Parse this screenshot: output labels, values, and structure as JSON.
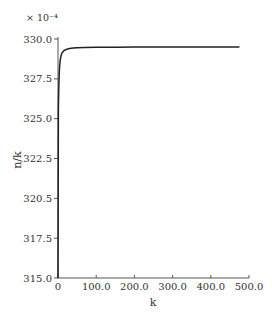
{
  "chart_data": {
    "type": "line",
    "title": "",
    "xlabel": "k",
    "ylabel": "n/k",
    "y_scale_note": "× 10⁻⁴",
    "xlim": [
      0,
      500
    ],
    "ylim": [
      315.0,
      330.0
    ],
    "grid": false,
    "legend": null,
    "x_ticks": [
      0,
      100,
      200,
      300,
      400,
      500
    ],
    "x_tick_labels": [
      "0",
      "100.0",
      "200.0",
      "300.0",
      "400.0",
      "500.0"
    ],
    "y_ticks": [
      315.0,
      317.5,
      320.0,
      322.5,
      325.0,
      327.5,
      330.0
    ],
    "y_tick_labels": [
      "315.0",
      "317.5",
      "320.5",
      "322.5",
      "325.0",
      "327.5",
      "330.0"
    ],
    "series": [
      {
        "name": "n/k",
        "color": "#222222",
        "x": [
          1,
          2,
          3,
          4,
          6,
          8,
          10,
          13,
          16,
          20,
          25,
          30,
          40,
          50,
          70,
          100,
          150,
          200,
          250,
          300,
          350,
          400,
          450,
          475
        ],
        "y": [
          325.6,
          326.9,
          327.7,
          328.2,
          328.7,
          328.95,
          329.1,
          329.2,
          329.28,
          329.33,
          329.37,
          329.4,
          329.43,
          329.45,
          329.47,
          329.48,
          329.49,
          329.5,
          329.5,
          329.5,
          329.5,
          329.5,
          329.5,
          329.5
        ]
      }
    ]
  },
  "layout": {
    "plot_left": 58,
    "plot_right": 249,
    "plot_top": 39,
    "plot_bottom": 278
  }
}
